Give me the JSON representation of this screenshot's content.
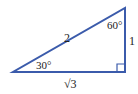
{
  "diagram": {
    "type": "right-triangle",
    "stroke_color": "#3b5bab",
    "label_color": "#222222",
    "hypotenuse_label": "2",
    "vertical_leg_label": "1",
    "horizontal_leg_label": "√3",
    "angle_left_label": "30°",
    "angle_top_label": "60°",
    "right_angle_marker": true
  }
}
